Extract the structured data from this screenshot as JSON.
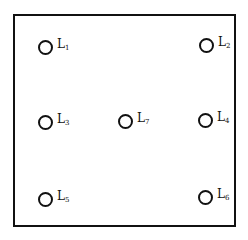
{
  "diagram": {
    "frame": {
      "border_color": "#111111"
    },
    "nodes": [
      {
        "id": "L1",
        "letter": "L",
        "sub": "1",
        "x": 45,
        "y": 47
      },
      {
        "id": "L2",
        "letter": "L",
        "sub": "2",
        "x": 206,
        "y": 45
      },
      {
        "id": "L3",
        "letter": "L",
        "sub": "3",
        "x": 45,
        "y": 122
      },
      {
        "id": "L7",
        "letter": "L",
        "sub": "7",
        "x": 125,
        "y": 121
      },
      {
        "id": "L4",
        "letter": "L",
        "sub": "4",
        "x": 205,
        "y": 120
      },
      {
        "id": "L5",
        "letter": "L",
        "sub": "5",
        "x": 45,
        "y": 199
      },
      {
        "id": "L6",
        "letter": "L",
        "sub": "6",
        "x": 205,
        "y": 197
      }
    ]
  }
}
